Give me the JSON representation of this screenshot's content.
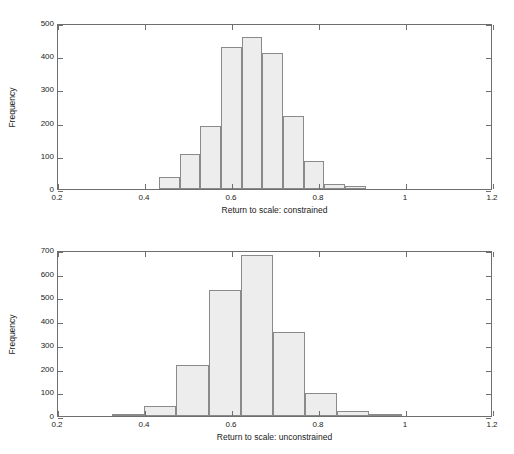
{
  "figure": {
    "background": "#ffffff",
    "bar_fill": "#ededed",
    "bar_edge": "#8a8a8a",
    "axis_color": "#6f6f6f"
  },
  "chart_data": [
    {
      "type": "bar",
      "subtype": "histogram",
      "title": "",
      "xlabel": "Return to scale: constrained",
      "ylabel": "Frequency",
      "xlim": [
        0.2,
        1.2
      ],
      "ylim": [
        0,
        500
      ],
      "xticks": [
        0.2,
        0.4,
        0.6,
        0.8,
        1,
        1.2
      ],
      "xticklabels": [
        "0.2",
        "0.4",
        "0.6",
        "0.8",
        "1",
        "1.2"
      ],
      "yticks": [
        0,
        100,
        200,
        300,
        400,
        500
      ],
      "yticklabels": [
        "0",
        "100",
        "200",
        "300",
        "400",
        "500"
      ],
      "grid": false,
      "legend": false,
      "bin_width": 0.0475,
      "bins": [
        {
          "x0": 0.4325,
          "x1": 0.48,
          "value": 35
        },
        {
          "x0": 0.48,
          "x1": 0.5275,
          "value": 106
        },
        {
          "x0": 0.5275,
          "x1": 0.575,
          "value": 191
        },
        {
          "x0": 0.575,
          "x1": 0.6225,
          "value": 428
        },
        {
          "x0": 0.6225,
          "x1": 0.67,
          "value": 459
        },
        {
          "x0": 0.67,
          "x1": 0.7175,
          "value": 409
        },
        {
          "x0": 0.7175,
          "x1": 0.765,
          "value": 219
        },
        {
          "x0": 0.765,
          "x1": 0.8125,
          "value": 83
        },
        {
          "x0": 0.8125,
          "x1": 0.86,
          "value": 16
        },
        {
          "x0": 0.86,
          "x1": 0.9075,
          "value": 8
        }
      ]
    },
    {
      "type": "bar",
      "subtype": "histogram",
      "title": "",
      "xlabel": "Return to scale: unconstrained",
      "ylabel": "Frequency",
      "xlim": [
        0.2,
        1.2
      ],
      "ylim": [
        0,
        700
      ],
      "xticks": [
        0.2,
        0.4,
        0.6,
        0.8,
        1,
        1.2
      ],
      "xticklabels": [
        "0.2",
        "0.4",
        "0.6",
        "0.8",
        "1",
        "1.2"
      ],
      "yticks": [
        0,
        100,
        200,
        300,
        400,
        500,
        600,
        700
      ],
      "yticklabels": [
        "0",
        "100",
        "200",
        "300",
        "400",
        "500",
        "600",
        "700"
      ],
      "grid": false,
      "legend": false,
      "bin_width": 0.074,
      "bins": [
        {
          "x0": 0.324,
          "x1": 0.398,
          "value": 5
        },
        {
          "x0": 0.398,
          "x1": 0.472,
          "value": 43
        },
        {
          "x0": 0.472,
          "x1": 0.546,
          "value": 215
        },
        {
          "x0": 0.546,
          "x1": 0.62,
          "value": 532
        },
        {
          "x0": 0.62,
          "x1": 0.694,
          "value": 678
        },
        {
          "x0": 0.694,
          "x1": 0.768,
          "value": 355
        },
        {
          "x0": 0.768,
          "x1": 0.842,
          "value": 97
        },
        {
          "x0": 0.842,
          "x1": 0.916,
          "value": 21
        },
        {
          "x0": 0.916,
          "x1": 0.99,
          "value": 2
        }
      ]
    }
  ]
}
